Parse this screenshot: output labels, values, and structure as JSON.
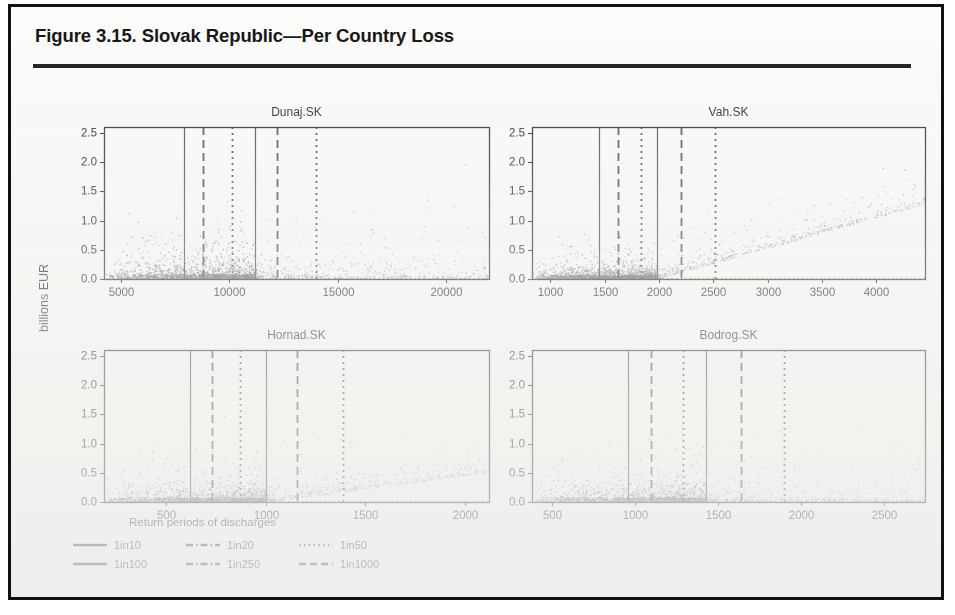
{
  "figure": {
    "title": "Figure 3.15. Slovak Republic—Per Country Loss",
    "axis_label_y": "billions EUR",
    "axis_label_x": "Return periods of discharges"
  },
  "legend": {
    "rows": [
      [
        {
          "label": "1in10",
          "style": "solid"
        },
        {
          "label": "1in20",
          "style": "dashdot"
        },
        {
          "label": "1in50",
          "style": "dotted"
        }
      ],
      [
        {
          "label": "1in100",
          "style": "solid"
        },
        {
          "label": "1in250",
          "style": "dashdot"
        },
        {
          "label": "1in1000",
          "style": "dashed"
        }
      ]
    ]
  },
  "chart_data": {
    "type": "scatter",
    "title": "Figure 3.15. Slovak Republic—Per Country Loss",
    "xlabel": "Return periods of discharges",
    "ylabel": "billions EUR",
    "grid": false,
    "legend_position": "bottom-left",
    "shared_ylim": [
      0.0,
      2.6
    ],
    "shared_yticks": [
      0.0,
      0.5,
      1.0,
      1.5,
      2.0,
      2.5
    ],
    "ytick_labels": [
      "0.0",
      "0.5",
      "1.0",
      "1.5",
      "2.0",
      "2.5"
    ],
    "point_color": "#6a6a6a",
    "line_color": "#3a3a3a",
    "panels": [
      {
        "name": "Dunaj.SK",
        "row": 0,
        "col": 0,
        "xlim": [
          4200,
          22000
        ],
        "xticks": [
          5000,
          10000,
          15000,
          20000
        ],
        "xtick_labels": [
          "5000",
          "10000",
          "15000",
          "20000"
        ],
        "n_points": 2600,
        "cluster_x_max": 11200,
        "ridge_level": 0.055,
        "spread_scale": 0.3,
        "tail_slope": 0.0,
        "vlines": [
          {
            "x": 7900,
            "style": "solid",
            "label": "1in10"
          },
          {
            "x": 8800,
            "style": "dashed",
            "label": "1in20"
          },
          {
            "x": 10100,
            "style": "dotted",
            "label": "1in50"
          },
          {
            "x": 11200,
            "style": "solid",
            "label": "1in100"
          },
          {
            "x": 12200,
            "style": "dashed",
            "label": "1in250"
          },
          {
            "x": 14000,
            "style": "dotted",
            "label": "1in1000"
          }
        ]
      },
      {
        "name": "Vah.SK",
        "row": 0,
        "col": 1,
        "xlim": [
          830,
          4450
        ],
        "xticks": [
          1000,
          1500,
          2000,
          2500,
          3000,
          3500,
          4000
        ],
        "xtick_labels": [
          "1000",
          "1500",
          "2000",
          "2500",
          "3000",
          "3500",
          "4000"
        ],
        "n_points": 2600,
        "cluster_x_max": 1980,
        "ridge_level": 0.045,
        "spread_scale": 0.2,
        "tail_slope": 0.00052,
        "vlines": [
          {
            "x": 1450,
            "style": "solid",
            "label": "1in10"
          },
          {
            "x": 1620,
            "style": "dashed",
            "label": "1in20"
          },
          {
            "x": 1830,
            "style": "dotted",
            "label": "1in50"
          },
          {
            "x": 1980,
            "style": "solid",
            "label": "1in100"
          },
          {
            "x": 2200,
            "style": "dashed",
            "label": "1in250"
          },
          {
            "x": 2520,
            "style": "dotted",
            "label": "1in1000"
          }
        ]
      },
      {
        "name": "Hornad.SK",
        "row": 1,
        "col": 0,
        "xlim": [
          190,
          2120
        ],
        "xticks": [
          500,
          1000,
          1500,
          2000
        ],
        "xtick_labels": [
          "500",
          "1000",
          "1500",
          "2000"
        ],
        "n_points": 2600,
        "cluster_x_max": 1000,
        "ridge_level": 0.05,
        "spread_scale": 0.28,
        "tail_slope": 0.00045,
        "vlines": [
          {
            "x": 620,
            "style": "solid",
            "label": "1in10"
          },
          {
            "x": 730,
            "style": "dashed",
            "label": "1in20"
          },
          {
            "x": 870,
            "style": "dotted",
            "label": "1in50"
          },
          {
            "x": 1000,
            "style": "solid",
            "label": "1in100"
          },
          {
            "x": 1160,
            "style": "dashed",
            "label": "1in250"
          },
          {
            "x": 1390,
            "style": "dotted",
            "label": "1in1000"
          }
        ]
      },
      {
        "name": "Bodrog.SK",
        "row": 1,
        "col": 1,
        "xlim": [
          380,
          2750
        ],
        "xticks": [
          500,
          1000,
          1500,
          2000,
          2500
        ],
        "xtick_labels": [
          "500",
          "1000",
          "1500",
          "2000",
          "2500"
        ],
        "n_points": 2600,
        "cluster_x_max": 1430,
        "ridge_level": 0.05,
        "spread_scale": 0.3,
        "tail_slope": 0.0,
        "vlines": [
          {
            "x": 960,
            "style": "solid",
            "label": "1in10"
          },
          {
            "x": 1100,
            "style": "dashed",
            "label": "1in20"
          },
          {
            "x": 1290,
            "style": "dotted",
            "label": "1in50"
          },
          {
            "x": 1430,
            "style": "solid",
            "label": "1in100"
          },
          {
            "x": 1640,
            "style": "dashed",
            "label": "1in250"
          },
          {
            "x": 1900,
            "style": "dotted",
            "label": "1in1000"
          }
        ]
      }
    ]
  }
}
